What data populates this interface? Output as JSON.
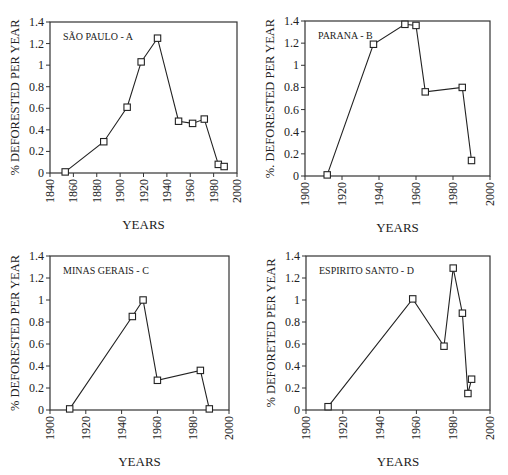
{
  "chart_data": [
    {
      "type": "line",
      "panel": "A",
      "title": "SÃO PAULO - A",
      "xlabel": "YEARS",
      "ylabel": "% DEFORESTED PER YEAR",
      "xlim": [
        1840,
        2000
      ],
      "ylim": [
        0,
        1.4
      ],
      "xticks": [
        1840,
        1860,
        1880,
        1900,
        1920,
        1940,
        1960,
        1980,
        2000
      ],
      "yticks": [
        0,
        0.2,
        0.4,
        0.6,
        0.8,
        1,
        1.2,
        1.4
      ],
      "ytick_labels": [
        "0",
        "0.2",
        "0.4",
        "0.6",
        "0.8",
        "1",
        "1.2",
        "1.4"
      ],
      "grid": false,
      "marker": "open-square",
      "x": [
        1853,
        1886,
        1906,
        1918,
        1932,
        1950,
        1962,
        1972,
        1984,
        1989
      ],
      "y": [
        0.01,
        0.29,
        0.61,
        1.03,
        1.25,
        0.48,
        0.46,
        0.5,
        0.08,
        0.06
      ],
      "frame": {
        "left": 50,
        "top": 22,
        "right": 237,
        "bottom": 173
      }
    },
    {
      "type": "line",
      "panel": "B",
      "title": "PARANA - B",
      "xlabel": "YEARS",
      "ylabel": "%. DEFORESTED PER YEAR",
      "xlim": [
        1900,
        2000
      ],
      "ylim": [
        0,
        1.4
      ],
      "xticks": [
        1900,
        1920,
        1940,
        1960,
        1980,
        2000
      ],
      "yticks": [
        0,
        0.2,
        0.4,
        0.6,
        0.8,
        1,
        1.2,
        1.4
      ],
      "ytick_labels": [
        "0",
        "0.2",
        "0.4",
        "0.6",
        "0.8",
        "1",
        "1.2",
        "1.4"
      ],
      "grid": false,
      "marker": "open-square",
      "x": [
        1912,
        1937,
        1954,
        1960,
        1965,
        1985,
        1990
      ],
      "y": [
        0.01,
        1.19,
        1.37,
        1.36,
        0.76,
        0.8,
        0.14
      ],
      "frame": {
        "left": 305,
        "top": 21,
        "right": 490,
        "bottom": 176
      }
    },
    {
      "type": "line",
      "panel": "C",
      "title": "MINAS GERAIS - C",
      "xlabel": "YEARS",
      "ylabel": "% DEFORESTED PER YEAR",
      "xlim": [
        1900,
        2000
      ],
      "ylim": [
        0,
        1.4
      ],
      "xticks": [
        1900,
        1920,
        1940,
        1960,
        1980,
        2000
      ],
      "yticks": [
        0,
        0.2,
        0.4,
        0.6,
        0.8,
        1,
        1.2,
        1.4
      ],
      "ytick_labels": [
        "0",
        "0.2",
        "0.4",
        "0.6",
        "0.8",
        "1",
        "1.2",
        "1.4"
      ],
      "grid": false,
      "marker": "open-square",
      "x": [
        1911,
        1946,
        1952,
        1960,
        1984,
        1989
      ],
      "y": [
        0.01,
        0.85,
        1.0,
        0.27,
        0.36,
        0.01
      ],
      "frame": {
        "left": 50,
        "top": 256,
        "right": 229,
        "bottom": 410
      }
    },
    {
      "type": "line",
      "panel": "D",
      "title": "ESPIRITO SANTO - D",
      "xlabel": "YEARS",
      "ylabel": "% DEFORETED PER YEAR",
      "xlim": [
        1900,
        2000
      ],
      "ylim": [
        0,
        1.4
      ],
      "xticks": [
        1900,
        1920,
        1940,
        1960,
        1980,
        2000
      ],
      "yticks": [
        0,
        0.2,
        0.4,
        0.6,
        0.8,
        1,
        1.2,
        1.4
      ],
      "ytick_labels": [
        "0",
        "0.2",
        "0.4",
        "0.6",
        "0.8",
        "1",
        "1.2",
        "1.4"
      ],
      "grid": false,
      "marker": "open-square",
      "x": [
        1912,
        1958,
        1975,
        1980,
        1985,
        1988,
        1990
      ],
      "y": [
        0.03,
        1.01,
        0.58,
        1.29,
        0.88,
        0.15,
        0.28
      ],
      "frame": {
        "left": 306,
        "top": 256,
        "right": 490,
        "bottom": 410
      }
    }
  ],
  "style": {
    "line_color": "#222222",
    "axis_color": "#333333",
    "background": "#ffffff"
  }
}
